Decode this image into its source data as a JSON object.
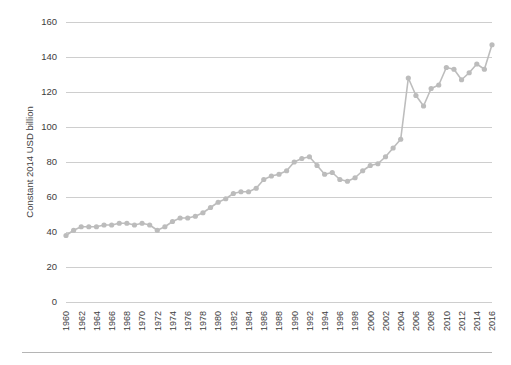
{
  "chart_data": {
    "type": "line",
    "title": "",
    "xlabel": "",
    "ylabel": "Constant 2014 USD billion",
    "xlim": [
      1960,
      2016
    ],
    "ylim": [
      0,
      160
    ],
    "yticks": [
      0,
      20,
      40,
      60,
      80,
      100,
      120,
      140,
      160
    ],
    "ytick_labels": [
      "0",
      "20",
      "40",
      "60",
      "80",
      "100",
      "120",
      "140",
      "160"
    ],
    "grid": true,
    "legend": "none",
    "marker": "circle",
    "line_color": "#bdbdbd",
    "marker_color": "#bcbcbc",
    "grid_color": "#c9c9c9",
    "xtick_labels": [
      "1960",
      "1962",
      "1964",
      "1966",
      "1968",
      "1970",
      "1972",
      "1974",
      "1976",
      "1978",
      "1980",
      "1982",
      "1984",
      "1986",
      "1988",
      "1990",
      "1992",
      "1994",
      "1996",
      "1998",
      "2000",
      "2002",
      "2004",
      "2006",
      "2008",
      "2010",
      "2012",
      "2014",
      "2016"
    ],
    "x": [
      1960,
      1961,
      1962,
      1963,
      1964,
      1965,
      1966,
      1967,
      1968,
      1969,
      1970,
      1971,
      1972,
      1973,
      1974,
      1975,
      1976,
      1977,
      1978,
      1979,
      1980,
      1981,
      1982,
      1983,
      1984,
      1985,
      1986,
      1987,
      1988,
      1989,
      1990,
      1991,
      1992,
      1993,
      1994,
      1995,
      1996,
      1997,
      1998,
      1999,
      2000,
      2001,
      2002,
      2003,
      2004,
      2005,
      2006,
      2007,
      2008,
      2009,
      2010,
      2011,
      2012,
      2013,
      2014,
      2015,
      2016
    ],
    "values": [
      38,
      41,
      43,
      43,
      43,
      44,
      44,
      45,
      45,
      44,
      45,
      44,
      41,
      43,
      46,
      48,
      48,
      49,
      51,
      54,
      57,
      59,
      62,
      63,
      63,
      65,
      70,
      72,
      73,
      75,
      80,
      82,
      83,
      78,
      73,
      74,
      70,
      69,
      71,
      75,
      78,
      79,
      83,
      88,
      93,
      128,
      118,
      112,
      122,
      124,
      134,
      133,
      127,
      131,
      136,
      133,
      147
    ],
    "series": [
      {
        "name": "Constant 2014 USD billion",
        "values": [
          38,
          41,
          43,
          43,
          43,
          44,
          44,
          45,
          45,
          44,
          45,
          44,
          41,
          43,
          46,
          48,
          48,
          49,
          51,
          54,
          57,
          59,
          62,
          63,
          63,
          65,
          70,
          72,
          73,
          75,
          80,
          82,
          83,
          78,
          73,
          74,
          70,
          69,
          71,
          75,
          78,
          79,
          83,
          88,
          93,
          128,
          118,
          112,
          122,
          124,
          134,
          133,
          127,
          131,
          136,
          133,
          147
        ]
      }
    ]
  },
  "layout": {
    "plot_left": 66,
    "plot_right": 492,
    "plot_top": 22,
    "plot_bottom": 302,
    "footer_rule_left": 22,
    "footer_rule_right": 492,
    "footer_rule_y": 352
  }
}
